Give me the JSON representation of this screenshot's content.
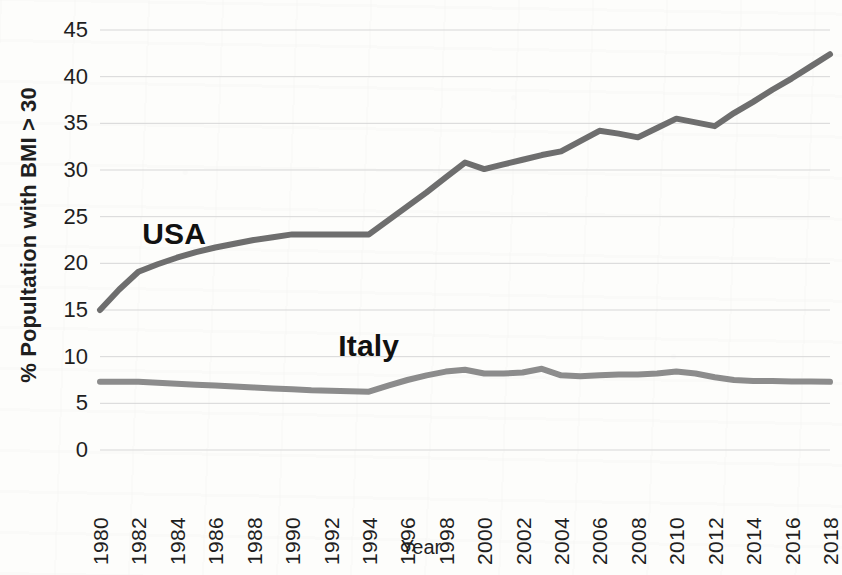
{
  "chart_data": {
    "type": "line",
    "title": "",
    "xlabel": "Year",
    "ylabel": "% Popultation with BMI > 30",
    "xlim": [
      1980,
      2018
    ],
    "ylim": [
      0,
      45
    ],
    "ytick_step": 5,
    "xtick_step": 2,
    "grid": "horizontal",
    "legend": "inline-labels",
    "x": [
      1980,
      1981,
      1982,
      1983,
      1984,
      1985,
      1986,
      1987,
      1988,
      1989,
      1990,
      1991,
      1992,
      1993,
      1994,
      1995,
      1996,
      1997,
      1998,
      1999,
      2000,
      2001,
      2002,
      2003,
      2004,
      2005,
      2006,
      2007,
      2008,
      2009,
      2010,
      2011,
      2012,
      2013,
      2014,
      2015,
      2016,
      2017,
      2018
    ],
    "ytick_labels": [
      "45",
      "40",
      "35",
      "30",
      "25",
      "20",
      "15",
      "10",
      "5",
      "0"
    ],
    "xtick_labels": [
      "1980",
      "1982",
      "1984",
      "1986",
      "1988",
      "1990",
      "1992",
      "1994",
      "1996",
      "1998",
      "2000",
      "2002",
      "2004",
      "2006",
      "2008",
      "2010",
      "2012",
      "2014",
      "2016",
      "2018"
    ],
    "series": [
      {
        "name": "USA",
        "color": "#6e6e6e",
        "label_x": 1982.2,
        "label_y": 22.6,
        "values": [
          15.0,
          17.2,
          19.1,
          19.9,
          20.6,
          21.2,
          21.7,
          22.1,
          22.5,
          22.8,
          23.1,
          23.1,
          23.1,
          23.1,
          23.1,
          24.6,
          26.1,
          27.6,
          29.2,
          30.8,
          30.1,
          30.6,
          31.1,
          31.6,
          32.0,
          33.1,
          34.2,
          33.9,
          33.5,
          34.5,
          35.5,
          35.1,
          34.7,
          36.1,
          37.3,
          38.6,
          39.8,
          41.1,
          42.4
        ]
      },
      {
        "name": "Italy",
        "color": "#8c8c8c",
        "label_x": 1992.4,
        "label_y": 10.6,
        "values": [
          7.3,
          7.3,
          7.3,
          7.2,
          7.1,
          7.0,
          6.9,
          6.8,
          6.7,
          6.6,
          6.5,
          6.4,
          6.35,
          6.3,
          6.25,
          6.9,
          7.5,
          8.0,
          8.4,
          8.6,
          8.2,
          8.2,
          8.3,
          8.7,
          8.0,
          7.9,
          8.0,
          8.1,
          8.1,
          8.2,
          8.4,
          8.2,
          7.8,
          7.5,
          7.4,
          7.4,
          7.35,
          7.35,
          7.3
        ]
      }
    ]
  },
  "axes": {
    "y_axis_title": "% Popultation with BMI > 30",
    "x_axis_title": "Year"
  },
  "colors": {
    "usa_line": "#6e6e6e",
    "italy_line": "#8c8c8c",
    "gridline": "#d7d7d7",
    "axis_text": "#1f1f1f",
    "background": "#fdfdfb"
  }
}
